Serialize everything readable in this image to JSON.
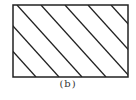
{
  "figure": {
    "caption": "(b)",
    "shape": "hatched-rectangle",
    "stroke_color": "#222222",
    "background": "#ffffff",
    "rect": {
      "x": 13,
      "y": 5,
      "width": 115,
      "height": 72
    },
    "hatch": {
      "direction": "diagonal-down-right",
      "line_count": 7,
      "spacing_px": 23
    }
  }
}
